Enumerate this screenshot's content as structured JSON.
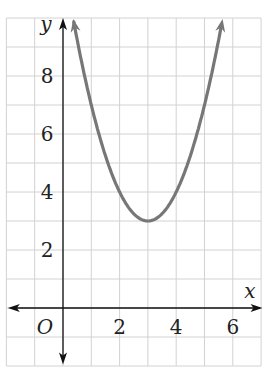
{
  "chart_data": {
    "type": "line",
    "title": "",
    "xlabel": "x",
    "ylabel": "y",
    "origin_label": "O",
    "x_ticks": [
      "2",
      "4",
      "6"
    ],
    "y_ticks": [
      "2",
      "4",
      "6",
      "8"
    ],
    "xlim": [
      -2,
      7
    ],
    "ylim": [
      -2,
      10
    ],
    "grid": true,
    "series": [
      {
        "name": "parabola",
        "equation": "y = (x - 3)^2 + 3",
        "vertex": [
          3,
          3
        ],
        "color": "#777777",
        "x": [
          0.35,
          1,
          2,
          3,
          4,
          5,
          5.65
        ],
        "values": [
          10,
          7,
          4,
          3,
          4,
          7,
          10
        ]
      }
    ]
  }
}
